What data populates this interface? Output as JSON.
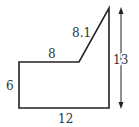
{
  "diagram": {
    "type": "geometry-figure",
    "shape": "pentagon",
    "labels": {
      "left_side": "6",
      "top_side": "8",
      "slant_side": "8.1",
      "bottom_side": "12",
      "height": "13"
    },
    "colors": {
      "stroke": "#222222",
      "text": "#333333"
    }
  }
}
